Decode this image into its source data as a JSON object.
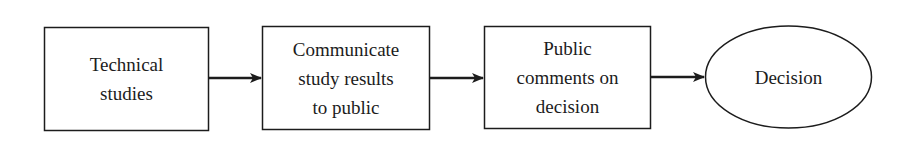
{
  "diagram": {
    "type": "flowchart",
    "direction": "left-to-right",
    "colors": {
      "stroke": "#1c1c1c",
      "fill": "#ffffff",
      "text": "#1c1c1c"
    },
    "nodes": [
      {
        "id": "technical-studies",
        "shape": "rectangle",
        "lines": [
          "Technical",
          "studies"
        ]
      },
      {
        "id": "communicate-results",
        "shape": "rectangle",
        "lines": [
          "Communicate",
          "study results",
          "to public"
        ]
      },
      {
        "id": "public-comments",
        "shape": "rectangle",
        "lines": [
          "Public",
          "comments on",
          "decision"
        ]
      },
      {
        "id": "decision",
        "shape": "ellipse",
        "lines": [
          "Decision"
        ]
      }
    ],
    "edges": [
      {
        "from": "technical-studies",
        "to": "communicate-results"
      },
      {
        "from": "communicate-results",
        "to": "public-comments"
      },
      {
        "from": "public-comments",
        "to": "decision"
      }
    ]
  }
}
